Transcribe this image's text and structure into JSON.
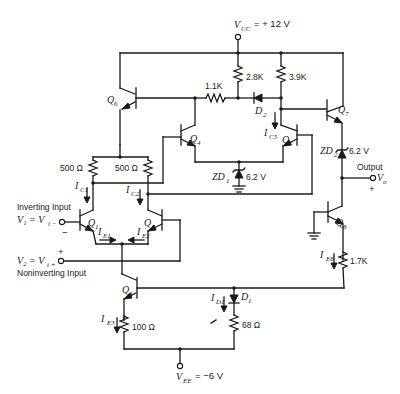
{
  "diagram": {
    "type": "circuit-schematic",
    "supplies": {
      "vcc": {
        "label": "V",
        "sub": "CC",
        "value": "= + 12 V"
      },
      "vee": {
        "label": "V",
        "sub": "EE",
        "value": "= −6 V"
      }
    },
    "transistors": [
      {
        "id": "Q1",
        "label": "Q",
        "sub": "1"
      },
      {
        "id": "Q2",
        "label": "Q",
        "sub": "2"
      },
      {
        "id": "Q3",
        "label": "Q",
        "sub": "3"
      },
      {
        "id": "Q4",
        "label": "Q",
        "sub": "4"
      },
      {
        "id": "Q5",
        "label": "Q",
        "sub": "5"
      },
      {
        "id": "Q6",
        "label": "Q",
        "sub": "6"
      },
      {
        "id": "Q7",
        "label": "Q",
        "sub": "7"
      },
      {
        "id": "Q8",
        "label": "Q",
        "sub": "8"
      }
    ],
    "resistors": {
      "r_2_8k": "2.8K",
      "r_3_9k": "3.9K",
      "r_1_1k": "1.1K",
      "r_500_left": "500 Ω",
      "r_500_right": "500 Ω",
      "r_100": "100 Ω",
      "r_68": "68 Ω",
      "r_1_7k": "1.7K"
    },
    "diodes": {
      "d1": {
        "label": "D",
        "sub": "1"
      },
      "d2": {
        "label": "D",
        "sub": "2"
      },
      "zd1": {
        "label": "ZD",
        "sub": "1",
        "value": "6.2 V"
      },
      "zd2": {
        "label": "ZD",
        "sub": "2",
        "value": "6.2 V"
      }
    },
    "currents": {
      "ic1": {
        "label": "I",
        "sub": "C1"
      },
      "ic2": {
        "label": "I",
        "sub": "C2"
      },
      "ie1": {
        "label": "I",
        "sub": "E1"
      },
      "ie2": {
        "label": "I",
        "sub": "E2"
      },
      "ie3": {
        "label": "I",
        "sub": "E3"
      },
      "ic5": {
        "label": "I",
        "sub": "C5"
      },
      "ie8": {
        "label": "I",
        "sub": "E8"
      },
      "id1": {
        "label": "I",
        "sub": "D1"
      }
    },
    "inputs": {
      "inverting_title": "Inverting Input",
      "inverting_eq": "V₁ = V",
      "inverting_sub": "i −",
      "inverting_sign": "−",
      "noninverting_title": "Noninverting Input",
      "noninverting_eq": "V₂ = V",
      "noninverting_sub": "i +",
      "noninverting_sign": "+"
    },
    "output": {
      "title": "Output",
      "label": "V",
      "sub": "o",
      "sign": "+"
    }
  }
}
